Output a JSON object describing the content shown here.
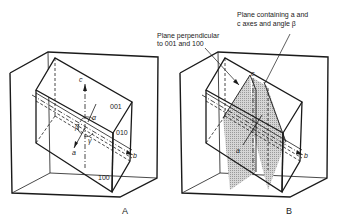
{
  "panels": [
    {
      "caption": "A",
      "face_labels": [
        "001",
        "010",
        "100"
      ],
      "axis_labels": {
        "a": "a",
        "b": "b",
        "c": "c"
      },
      "angle_labels": {
        "alpha": "α",
        "beta": "β",
        "gamma": "γ"
      }
    },
    {
      "caption": "B",
      "axis_labels": {
        "a": "a",
        "b": "b",
        "c": "c"
      },
      "annotations": {
        "perpendicular_line1": "Plane perpendicular",
        "perpendicular_line2": "to 001 and 100",
        "containing_line1": "Plane containing a and",
        "containing_line2": "c axes and angle β"
      }
    }
  ],
  "colors": {
    "line": "#1a1a1a",
    "shade": "#c8c8c8",
    "background": "#ffffff"
  }
}
